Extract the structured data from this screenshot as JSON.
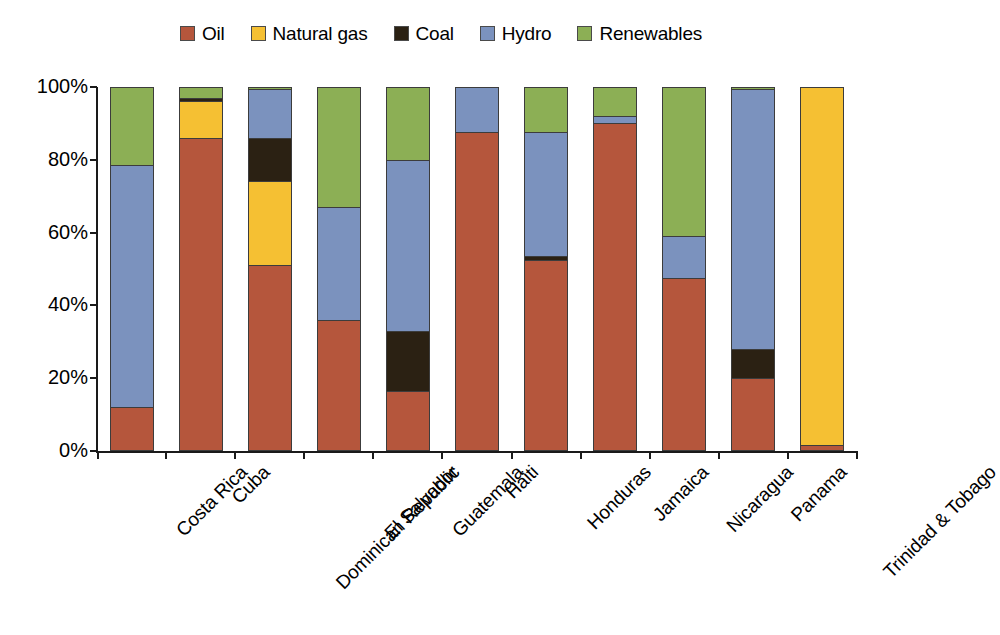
{
  "chart_data": {
    "type": "bar",
    "subtype": "stacked-bar-100-percent",
    "title": "",
    "xlabel": "",
    "ylabel": "",
    "ylim": [
      0,
      100
    ],
    "ytick_labels": [
      "0%",
      "20%",
      "40%",
      "60%",
      "80%",
      "100%"
    ],
    "ytick_values": [
      0,
      20,
      40,
      60,
      80,
      100
    ],
    "grid": false,
    "legend_position": "top-center",
    "stacking_order_bottom_to_top": [
      "Oil",
      "Natural gas",
      "Coal",
      "Hydro",
      "Renewables"
    ],
    "categories": [
      "Costa Rica",
      "Cuba",
      "Dominican Republic",
      "El Salvador",
      "Guatemala",
      "Haiti",
      "Honduras",
      "Jamaica",
      "Nicaragua",
      "Panama",
      "Trinidad & Tobago"
    ],
    "series": [
      {
        "name": "Oil",
        "color": "#B5563C",
        "values": [
          11.5,
          85.5,
          50.5,
          35.5,
          16.0,
          87.0,
          52.0,
          89.5,
          47.0,
          19.5,
          1.0
        ]
      },
      {
        "name": "Natural gas",
        "color": "#F5C033",
        "values": [
          0,
          10.0,
          23.0,
          0,
          0,
          0,
          0,
          0,
          0,
          0,
          99.0
        ]
      },
      {
        "name": "Coal",
        "color": "#2B2113",
        "values": [
          0,
          1.0,
          12.0,
          0,
          16.5,
          0,
          1.0,
          0,
          0,
          8.0,
          0
        ]
      },
      {
        "name": "Hydro",
        "color": "#7B92BE",
        "values": [
          66.5,
          0,
          13.5,
          31.0,
          47.0,
          13.0,
          34.0,
          2.0,
          11.5,
          71.5,
          0
        ]
      },
      {
        "name": "Renewables",
        "color": "#8CAF55",
        "values": [
          22.0,
          3.5,
          1.0,
          33.5,
          20.5,
          0,
          13.0,
          8.5,
          41.5,
          1.0,
          0
        ]
      }
    ]
  },
  "legend": {
    "items": [
      {
        "label": "Oil",
        "color": "#B5563C"
      },
      {
        "label": "Natural gas",
        "color": "#F5C033"
      },
      {
        "label": "Coal",
        "color": "#2B2113"
      },
      {
        "label": "Hydro",
        "color": "#7B92BE"
      },
      {
        "label": "Renewables",
        "color": "#8CAF55"
      }
    ]
  }
}
